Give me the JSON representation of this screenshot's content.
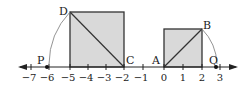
{
  "diagram": {
    "type": "number-line-with-squares",
    "axis": {
      "ticks": [
        {
          "value": -7,
          "label": "−7",
          "x": 31
        },
        {
          "value": -6,
          "label": "−6",
          "x": 49
        },
        {
          "value": -5,
          "label": "−5",
          "x": 70
        },
        {
          "value": -4,
          "label": "−4",
          "x": 88
        },
        {
          "value": -3,
          "label": "−3",
          "x": 106
        },
        {
          "value": -2,
          "label": "−2",
          "x": 124
        },
        {
          "value": -1,
          "label": "−1",
          "x": 143
        },
        {
          "value": 0,
          "label": "0",
          "x": 164
        },
        {
          "value": 1,
          "label": "1",
          "x": 183
        },
        {
          "value": 2,
          "label": "2",
          "x": 202
        },
        {
          "value": 3,
          "label": "3",
          "x": 220
        }
      ]
    },
    "points": {
      "D": "D",
      "C": "C",
      "A": "A",
      "B": "B",
      "P": "P",
      "Q": "Q"
    },
    "colors": {
      "square_fill": "#d9d9d9",
      "stroke": "#333333",
      "arc": "#888888"
    }
  }
}
